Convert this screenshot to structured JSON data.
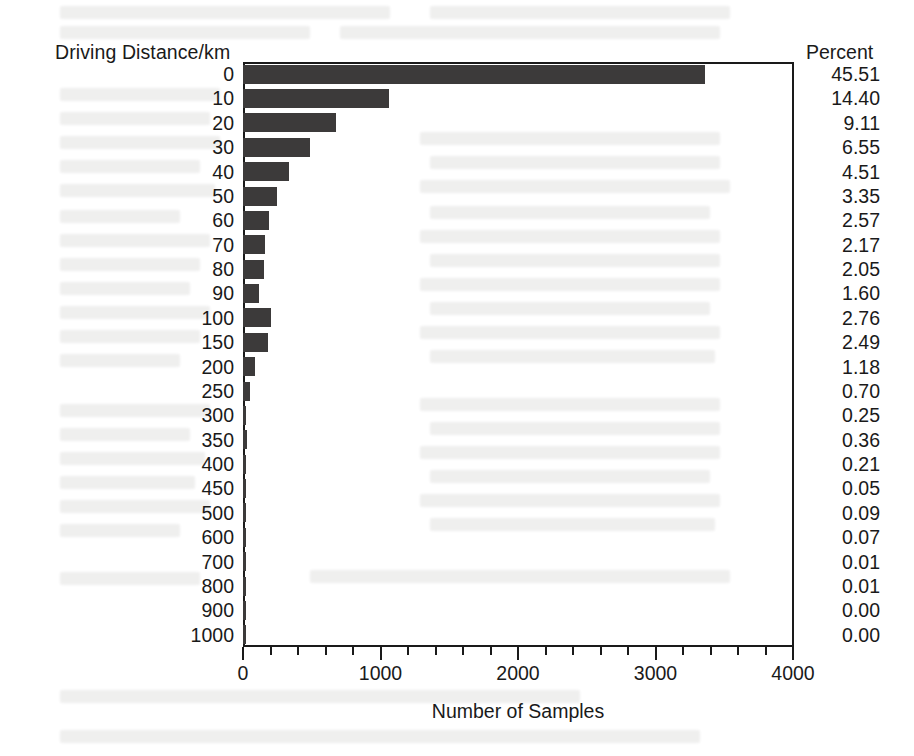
{
  "chart_data": {
    "type": "bar",
    "orientation": "horizontal",
    "title": "",
    "xlabel": "Number of Samples",
    "ylabel": "Driving Distance/km",
    "xlim": [
      0,
      4000
    ],
    "xticks": [
      0,
      1000,
      2000,
      3000,
      4000
    ],
    "xtick_labels": [
      "0",
      "1000",
      "2000",
      "3000",
      "4000"
    ],
    "grid": false,
    "legend": null,
    "categories": [
      "0",
      "10",
      "20",
      "30",
      "40",
      "50",
      "60",
      "70",
      "80",
      "90",
      "100",
      "150",
      "200",
      "250",
      "300",
      "350",
      "400",
      "450",
      "500",
      "600",
      "700",
      "800",
      "900",
      "1000"
    ],
    "values": [
      3360,
      1063,
      673,
      484,
      333,
      247,
      190,
      160,
      151,
      118,
      204,
      184,
      87,
      52,
      18,
      27,
      16,
      4,
      7,
      5,
      1,
      1,
      0,
      0
    ],
    "percent_column_header": "Percent",
    "percents": [
      "45.51",
      "14.40",
      "9.11",
      "6.55",
      "4.51",
      "3.35",
      "2.57",
      "2.17",
      "2.05",
      "1.60",
      "2.76",
      "2.49",
      "1.18",
      "0.70",
      "0.25",
      "0.36",
      "0.21",
      "0.05",
      "0.09",
      "0.07",
      "0.01",
      "0.01",
      "0.00",
      "0.00"
    ],
    "bar_color": "#3c3a3a",
    "axis_color": "#1a1a1a"
  },
  "axes": {
    "y_title": "Driving Distance/km",
    "x_title": "Number of Samples",
    "percent_title": "Percent"
  }
}
